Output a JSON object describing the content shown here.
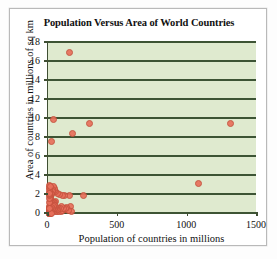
{
  "chart_data": {
    "type": "scatter",
    "title": "Population Versus Area of World Countries",
    "xlabel": "Population of countries in millions",
    "ylabel": "Area of countries in millions of sq km",
    "xlim": [
      0,
      1500
    ],
    "ylim": [
      0,
      18
    ],
    "xticks": [
      0,
      500,
      1000,
      1500
    ],
    "yticks": [
      0,
      2,
      4,
      6,
      8,
      10,
      12,
      14,
      16,
      18
    ],
    "grid": "horizontal",
    "legend": "none",
    "plot_background_color": "#dfeacf",
    "grid_color": "#3d5434",
    "point_color": "#e8705c",
    "points": [
      [
        145,
        17.0
      ],
      [
        31,
        9.95
      ],
      [
        290,
        9.55
      ],
      [
        1300,
        9.5
      ],
      [
        170,
        8.5
      ],
      [
        20,
        7.6
      ],
      [
        1070,
        3.2
      ],
      [
        250,
        1.9
      ],
      [
        150,
        1.9
      ],
      [
        110,
        1.9
      ],
      [
        95,
        1.95
      ],
      [
        75,
        2.05
      ],
      [
        60,
        2.2
      ],
      [
        48,
        2.35
      ],
      [
        42,
        2.5
      ],
      [
        36,
        2.7
      ],
      [
        30,
        2.85
      ],
      [
        25,
        2.6
      ],
      [
        22,
        2.4
      ],
      [
        18,
        2.2
      ],
      [
        15,
        2.05
      ],
      [
        12,
        1.9
      ],
      [
        10,
        1.75
      ],
      [
        9,
        1.6
      ],
      [
        8,
        1.5
      ],
      [
        45,
        1.3
      ],
      [
        40,
        1.25
      ],
      [
        35,
        1.2
      ],
      [
        28,
        1.15
      ],
      [
        24,
        1.1
      ],
      [
        20,
        1.05
      ],
      [
        17,
        1.0
      ],
      [
        14,
        0.95
      ],
      [
        11,
        0.9
      ],
      [
        9,
        0.85
      ],
      [
        7,
        0.8
      ],
      [
        6,
        0.7
      ],
      [
        5,
        0.6
      ],
      [
        4,
        0.5
      ],
      [
        3,
        0.45
      ],
      [
        2,
        0.4
      ],
      [
        2,
        0.3
      ],
      [
        1,
        0.25
      ],
      [
        1,
        0.15
      ],
      [
        1,
        0.1
      ],
      [
        3,
        0.05
      ],
      [
        5,
        0.1
      ],
      [
        8,
        0.15
      ],
      [
        12,
        0.2
      ],
      [
        16,
        0.3
      ],
      [
        19,
        0.35
      ],
      [
        23,
        0.42
      ],
      [
        27,
        0.5
      ],
      [
        33,
        0.33
      ],
      [
        38,
        0.28
      ],
      [
        44,
        0.36
      ],
      [
        52,
        0.3
      ],
      [
        58,
        0.25
      ],
      [
        65,
        0.4
      ],
      [
        72,
        0.3
      ],
      [
        80,
        0.45
      ],
      [
        88,
        0.3
      ],
      [
        100,
        0.35
      ],
      [
        120,
        0.45
      ],
      [
        135,
        0.5
      ],
      [
        155,
        0.8
      ],
      [
        160,
        0.3
      ],
      [
        140,
        0.35
      ],
      [
        128,
        0.65
      ],
      [
        115,
        0.55
      ],
      [
        105,
        0.6
      ],
      [
        92,
        0.75
      ],
      [
        85,
        0.55
      ],
      [
        70,
        0.6
      ],
      [
        62,
        0.5
      ],
      [
        55,
        0.55
      ],
      [
        50,
        0.65
      ],
      [
        46,
        0.75
      ],
      [
        41,
        0.85
      ],
      [
        37,
        0.6
      ],
      [
        32,
        0.7
      ],
      [
        29,
        0.8
      ],
      [
        26,
        0.6
      ],
      [
        21,
        0.7
      ],
      [
        13,
        0.55
      ],
      [
        6,
        0.35
      ],
      [
        4,
        0.2
      ],
      [
        2,
        0.08
      ],
      [
        1,
        0.03
      ],
      [
        5,
        0.02
      ],
      [
        10,
        0.05
      ],
      [
        15,
        0.08
      ],
      [
        0.5,
        0.6
      ],
      [
        0.5,
        1.2
      ],
      [
        1,
        1.6
      ],
      [
        2,
        1.9
      ],
      [
        3,
        2.1
      ],
      [
        4,
        2.3
      ],
      [
        6,
        2.55
      ],
      [
        7,
        2.75
      ],
      [
        5,
        2.95
      ],
      [
        3,
        2.2
      ],
      [
        8,
        2.9
      ]
    ]
  }
}
